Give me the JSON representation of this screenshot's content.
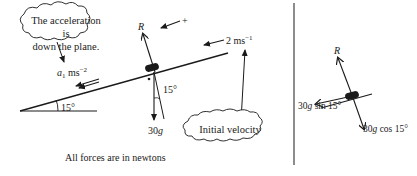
{
  "left_diagram": {
    "cloud_acceleration": {
      "line1": "The acceleration is",
      "line2": "down the plane."
    },
    "acceleration_label": {
      "symbol": "a",
      "subscript": "1",
      "unit": "ms",
      "exponent": "−2"
    },
    "reaction_label": "R",
    "positive_direction_label": "+",
    "velocity_label": {
      "value": "2 ms",
      "exponent": "−1"
    },
    "weight_label": {
      "value": "30",
      "g": "g"
    },
    "incline_angle_label": "15°",
    "weight_angle_label": "15°",
    "cloud_velocity": "Initial velocity",
    "footer_note": "All forces are in newtons"
  },
  "right_diagram": {
    "reaction_label": "R",
    "component_parallel": {
      "value": "30",
      "g": "g",
      "rest": " sin 15°"
    },
    "component_perpendicular": {
      "value": "30",
      "g": "g",
      "rest": " cos 15°"
    }
  },
  "colors": {
    "ink": "#1a1a1a",
    "background": "#ffffff"
  }
}
